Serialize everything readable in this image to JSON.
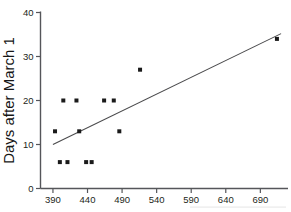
{
  "chart_data": {
    "type": "scatter",
    "title": "",
    "subtitle": "",
    "xlabel": "",
    "ylabel": "Days after March 1",
    "xlim": [
      372,
      730
    ],
    "ylim": [
      0,
      40
    ],
    "xticks": [
      390,
      440,
      490,
      540,
      590,
      640,
      690
    ],
    "xtick_labels": [
      "390",
      "440",
      "490",
      "540",
      "590",
      "640",
      "690"
    ],
    "yticks": [
      0,
      10,
      20,
      30,
      40
    ],
    "ytick_labels": [
      "0",
      "10",
      "20",
      "30",
      "40"
    ],
    "grid": false,
    "legend": false,
    "legend_position": "none",
    "marker": "square",
    "marker_color": "#1a1a1a",
    "series": [
      {
        "name": "observations",
        "points": [
          {
            "x": 400,
            "y": 6
          },
          {
            "x": 411,
            "y": 6
          },
          {
            "x": 438,
            "y": 6
          },
          {
            "x": 446,
            "y": 6
          },
          {
            "x": 393,
            "y": 13
          },
          {
            "x": 428,
            "y": 13
          },
          {
            "x": 486,
            "y": 13
          },
          {
            "x": 405,
            "y": 20
          },
          {
            "x": 424,
            "y": 20
          },
          {
            "x": 464,
            "y": 20
          },
          {
            "x": 478,
            "y": 20
          },
          {
            "x": 516,
            "y": 27
          },
          {
            "x": 714,
            "y": 34
          }
        ]
      }
    ],
    "trendline": {
      "name": "least-squares fit",
      "x_start": 390,
      "y_start": 10,
      "x_end": 720,
      "y_end": 35.2,
      "color": "#4a4a4c"
    }
  },
  "axes": {
    "y_title": "Days after March 1"
  }
}
